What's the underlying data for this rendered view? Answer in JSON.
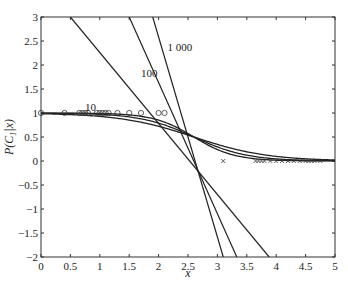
{
  "chart_data": {
    "type": "line",
    "title": "",
    "xlabel": "x",
    "ylabel": "P(C_1|x)",
    "xlim": [
      0,
      5
    ],
    "ylim": [
      -2,
      3
    ],
    "xticks": [
      "0",
      "0.5",
      "1",
      "1.5",
      "2",
      "2.5",
      "3",
      "3.5",
      "4",
      "4.5",
      "5"
    ],
    "yticks": [
      "-2",
      "-1.5",
      "-1",
      "-0.5",
      "0",
      "0.5",
      "1",
      "1.5",
      "2",
      "2.5",
      "3"
    ],
    "grid": false,
    "legend": "none",
    "lines": [
      {
        "name": "10",
        "kind": "linear",
        "x": [
          0.5,
          3.88
        ],
        "y": [
          3,
          -2
        ]
      },
      {
        "name": "100",
        "kind": "linear",
        "x": [
          1.5,
          3.33
        ],
        "y": [
          3,
          -2
        ]
      },
      {
        "name": "1 000",
        "kind": "linear",
        "x": [
          1.9,
          3.1
        ],
        "y": [
          3,
          -2
        ]
      }
    ],
    "sigmoids": [
      {
        "name": "sigmoid-10",
        "center": 2.6,
        "steepness": 1.6
      },
      {
        "name": "sigmoid-100",
        "center": 2.6,
        "steepness": 2.2
      },
      {
        "name": "sigmoid-1000",
        "center": 2.6,
        "steepness": 2.9
      }
    ],
    "markers_class1": {
      "symbol": "o",
      "y": 1,
      "x": [
        0.0,
        0.4,
        0.65,
        0.7,
        0.75,
        0.8,
        0.95,
        1.0,
        1.05,
        1.1,
        1.15,
        1.3,
        1.5,
        1.7,
        2.0,
        2.1
      ]
    },
    "markers_class0": {
      "symbol": "x",
      "y": 0,
      "x": [
        3.1,
        3.65,
        3.7,
        3.75,
        3.8,
        3.9,
        4.0,
        4.1,
        4.2,
        4.3,
        4.4,
        4.5,
        4.55,
        4.6,
        4.65,
        4.75
      ]
    },
    "line_labels": [
      {
        "text": "10",
        "x": 0.75,
        "y": 1.05
      },
      {
        "text": "100",
        "x": 1.7,
        "y": 1.75
      },
      {
        "text": "1 000",
        "x": 2.15,
        "y": 2.3
      }
    ]
  },
  "labels": {
    "xlabel": "x",
    "ylabel_main": "P(C",
    "ylabel_sub": "1",
    "ylabel_end": "|x)",
    "line10": "10",
    "line100": "100",
    "line1000": "1 000"
  }
}
